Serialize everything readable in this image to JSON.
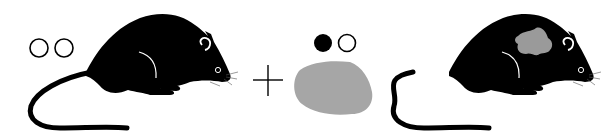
{
  "diagram": {
    "description": "Chimeric mouse generation: wild-type mouse plus heterozygous ES cell mass yields chimeric mouse",
    "colors": {
      "mouse_body": "#000000",
      "cell_mass": "#a6a6a6",
      "chimera_patch": "#9a9a9a",
      "background": "#ffffff"
    },
    "elements": [
      {
        "id": "donor-mouse",
        "label": "Wild-type mouse",
        "alleles": [
          "open",
          "open"
        ]
      },
      {
        "id": "plus-sign",
        "label": "+"
      },
      {
        "id": "es-cells",
        "label": "ES cell mass",
        "alleles": [
          "filled",
          "open"
        ]
      },
      {
        "id": "chimera-mouse",
        "label": "Chimeric mouse"
      }
    ],
    "operator": "+"
  }
}
